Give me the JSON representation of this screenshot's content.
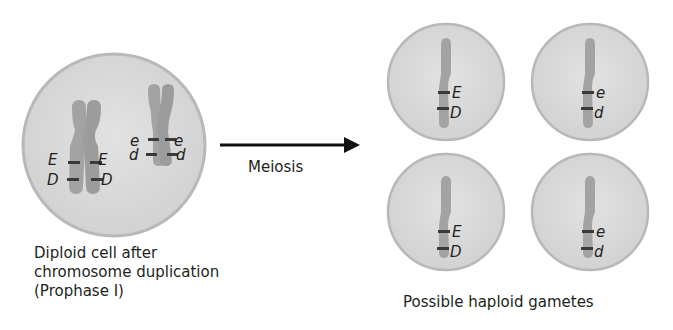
{
  "diagram": {
    "left_cell": {
      "caption_lines": [
        "Diploid cell after",
        "chromosome duplication",
        "(Prophase I)"
      ],
      "chromosome_1": {
        "alleles_left": [
          "E",
          "D"
        ],
        "alleles_right": [
          "E",
          "D"
        ]
      },
      "chromosome_2": {
        "alleles_left": [
          "e",
          "d"
        ],
        "alleles_right": [
          "e",
          "d"
        ]
      }
    },
    "arrow": {
      "label": "Meiosis"
    },
    "gametes": {
      "caption": "Possible haploid gametes",
      "cells": [
        {
          "position": "top-left",
          "alleles": [
            "E",
            "D"
          ]
        },
        {
          "position": "top-right",
          "alleles": [
            "e",
            "d"
          ]
        },
        {
          "position": "bottom-left",
          "alleles": [
            "E",
            "D"
          ]
        },
        {
          "position": "bottom-right",
          "alleles": [
            "e",
            "d"
          ]
        }
      ]
    },
    "colors": {
      "cell_fill": "#d9d9d9",
      "cell_border": "#b5b5b5",
      "chromosome": "#a3a3a3",
      "band": "#3a3a3a",
      "arrow": "#111111"
    }
  }
}
